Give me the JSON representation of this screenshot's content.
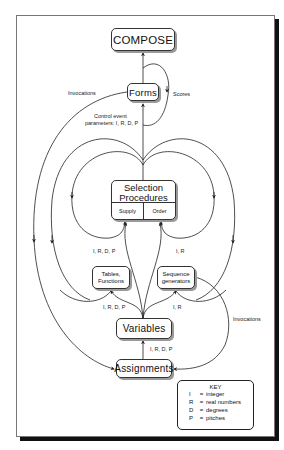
{
  "nodes": {
    "compose": "COMPOSE",
    "forms": "Forms",
    "selection": {
      "line1": "Selection",
      "line2": "Procedures",
      "supply": "Supply",
      "order": "Order"
    },
    "tables": {
      "line1": "Tables,",
      "line2": "Functions"
    },
    "sequence": {
      "line1": "Sequence",
      "line2": "generators"
    },
    "variables": "Variables",
    "assignments": "Assignments"
  },
  "edge_labels": {
    "invocations_left": "Invocations",
    "scores": "Scores",
    "control_line1": "Control event",
    "control_line2": "parameters: I, R, D, P",
    "left_irdp": "I, R, D, P",
    "right_ir": "I, R",
    "tables_irdp": "I, R, D, P",
    "sequence_ir": "I, R",
    "invocations_right": "Invocations",
    "assign_irdp": "I, R, D, P"
  },
  "key": {
    "title": "KEY",
    "entries": [
      {
        "symbol": "I",
        "eq": "=",
        "meaning": "integer"
      },
      {
        "symbol": "R",
        "eq": "=",
        "meaning": "real numbers"
      },
      {
        "symbol": "D",
        "eq": "=",
        "meaning": "degrees"
      },
      {
        "symbol": "P",
        "eq": "=",
        "meaning": "pitches"
      }
    ]
  },
  "colors": {
    "line": "#222222",
    "frame_shadow": "#111111",
    "node_shadow": "#9a9a9a"
  }
}
